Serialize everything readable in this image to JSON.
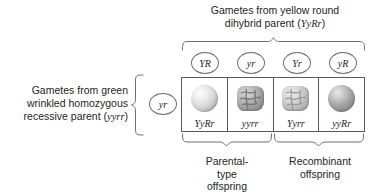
{
  "diagram": {
    "title_top_line1": "Gametes from yellow round",
    "title_top_line2_prefix": "dihybrid parent (",
    "title_top_genotype": "YyRr",
    "title_top_line2_suffix": ")",
    "title_left_line1": "Gametes from green",
    "title_left_line2": "wrinkled homozygous",
    "title_left_line3_prefix": "recessive parent (",
    "title_left_genotype": "yyrr",
    "title_left_line3_suffix": ")"
  },
  "top_gametes": [
    {
      "label": "YR",
      "x": 191
    },
    {
      "label": "yr",
      "x": 237
    },
    {
      "label": "Yr",
      "x": 283
    },
    {
      "label": "yR",
      "x": 329
    }
  ],
  "side_gamete": {
    "label": "yr"
  },
  "offspring": [
    {
      "genotype": "YyRr",
      "seed_shape": "round",
      "seed_color": "yellow",
      "group": "parental"
    },
    {
      "genotype": "yyrr",
      "seed_shape": "wrinkled",
      "seed_color": "green",
      "group": "parental"
    },
    {
      "genotype": "Yyrr",
      "seed_shape": "wrinkled",
      "seed_color": "yellow",
      "group": "recombinant"
    },
    {
      "genotype": "yyRr",
      "seed_shape": "round",
      "seed_color": "green",
      "group": "recombinant"
    }
  ],
  "bottom_labels": {
    "parental_line1": "Parental-",
    "parental_line2": "type",
    "parental_line3": "offspring",
    "recombinant_line1": "Recombinant",
    "recombinant_line2": "offspring"
  },
  "colors": {
    "text": "#231f20",
    "rule": "#58595b",
    "brace": "#6d6e71",
    "background": "#ffffff"
  }
}
